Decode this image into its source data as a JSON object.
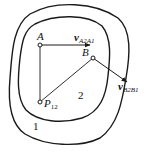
{
  "diagram": {
    "regions": {
      "outer_label": "1",
      "inner_label": "2"
    },
    "points": {
      "A": {
        "label": "A",
        "x": 40,
        "y": 45
      },
      "B": {
        "label": "B",
        "x": 93,
        "y": 58
      },
      "P12": {
        "label": "P",
        "subscript": "12",
        "x": 40,
        "y": 102
      }
    },
    "vectors": {
      "vA": {
        "symbol": "v",
        "subscript": "A2A1"
      },
      "vB": {
        "symbol": "v",
        "subscript": "B2B1"
      }
    },
    "colors": {
      "stroke": "#1a1a1a",
      "background": "#ffffff"
    }
  }
}
